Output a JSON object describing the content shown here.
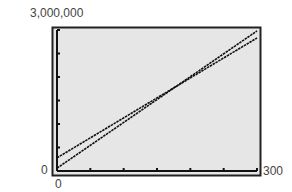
{
  "chart_data": {
    "type": "line",
    "title": "",
    "xlabel": "",
    "ylabel": "",
    "xlim": [
      0,
      300
    ],
    "ylim": [
      0,
      3000000
    ],
    "x_tick_labels": [
      "0",
      "300"
    ],
    "y_tick_labels": [
      "0",
      "3,000,000"
    ],
    "x_tick_count": 6,
    "y_tick_count": 6,
    "grid": false,
    "legend": null,
    "background": "#e6e6e6",
    "series": [
      {
        "name": "Line 1",
        "x": [
          0,
          300
        ],
        "y": [
          280000,
          2830000
        ]
      },
      {
        "name": "Line 2",
        "x": [
          0,
          300
        ],
        "y": [
          60000,
          2980000
        ]
      }
    ]
  },
  "labels": {
    "y_max": "3,000,000",
    "y_min": "0",
    "x_min": "0",
    "x_max": "300"
  }
}
